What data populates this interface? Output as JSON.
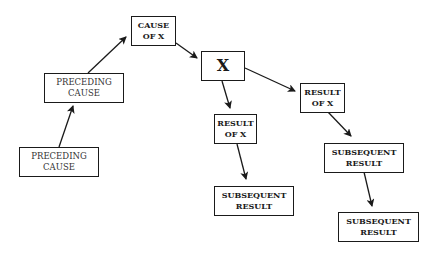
{
  "diagram": {
    "title": "",
    "type": "causal-chain",
    "nodes": [
      {
        "id": "preceding-cause-1",
        "lines": [
          "PRECEDING",
          "CAUSE"
        ]
      },
      {
        "id": "preceding-cause-2",
        "lines": [
          "PRECEDING",
          "CAUSE"
        ]
      },
      {
        "id": "cause-of-x",
        "lines": [
          "CAUSE",
          "OF X"
        ]
      },
      {
        "id": "x",
        "lines": [
          "X"
        ]
      },
      {
        "id": "result-of-x-1",
        "lines": [
          "RESULT",
          "OF X"
        ]
      },
      {
        "id": "result-of-x-2",
        "lines": [
          "RESULT",
          "OF X"
        ]
      },
      {
        "id": "subsequent-result-1",
        "lines": [
          "SUBSEQUENT",
          "RESULT"
        ]
      },
      {
        "id": "subsequent-result-2",
        "lines": [
          "SUBSEQUENT",
          "RESULT"
        ]
      },
      {
        "id": "subsequent-result-3",
        "lines": [
          "SUBSEQUENT",
          "RESULT"
        ]
      }
    ],
    "edges": [
      {
        "from": "preceding-cause-1",
        "to": "preceding-cause-2"
      },
      {
        "from": "preceding-cause-2",
        "to": "cause-of-x"
      },
      {
        "from": "cause-of-x",
        "to": "x"
      },
      {
        "from": "x",
        "to": "result-of-x-1"
      },
      {
        "from": "x",
        "to": "result-of-x-2"
      },
      {
        "from": "result-of-x-1",
        "to": "subsequent-result-1"
      },
      {
        "from": "result-of-x-2",
        "to": "subsequent-result-2"
      },
      {
        "from": "subsequent-result-2",
        "to": "subsequent-result-3"
      }
    ],
    "colors": {
      "stroke": "#1a1a1a",
      "background": "#ffffff"
    }
  }
}
